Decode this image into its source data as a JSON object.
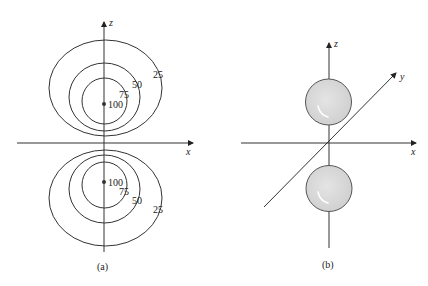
{
  "figure": {
    "panel_a": {
      "caption": "(a)",
      "axes": {
        "horizontal": "x",
        "vertical": "z"
      },
      "upper_contours": [
        {
          "label": "100"
        },
        {
          "label": "75"
        },
        {
          "label": "50"
        },
        {
          "label": "25"
        }
      ],
      "lower_contours": [
        {
          "label": "100"
        },
        {
          "label": "75"
        },
        {
          "label": "50"
        },
        {
          "label": "25"
        }
      ]
    },
    "panel_b": {
      "caption": "(b)",
      "axes": {
        "horizontal": "x",
        "vertical": "z",
        "depth": "y"
      },
      "sphere_fill": "#d6d6d6",
      "sphere_stroke": "#555555"
    },
    "line_color": "#333333"
  }
}
